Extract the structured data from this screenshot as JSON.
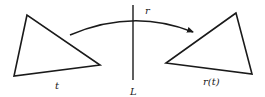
{
  "diagram": {
    "title": "",
    "labels": {
      "original_triangle": "t",
      "mirror_line": "L",
      "transformation": "r",
      "image_triangle": "r(t)"
    },
    "elements": [
      {
        "id": "triangle-t",
        "kind": "triangle",
        "label": "t"
      },
      {
        "id": "line-L",
        "kind": "vertical-line",
        "label": "L"
      },
      {
        "id": "arrow-r",
        "kind": "curved-arrow",
        "label": "r",
        "from": "triangle-t",
        "to": "triangle-r-t"
      },
      {
        "id": "triangle-r-t",
        "kind": "triangle",
        "label": "r(t)"
      }
    ],
    "colors": {
      "stroke": "#1a1a1a",
      "background": "#ffffff"
    }
  }
}
